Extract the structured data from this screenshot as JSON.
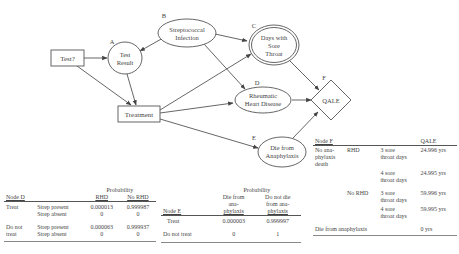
{
  "diagram": {
    "nodes": {
      "test": {
        "label": "Test?",
        "shape": "rectangle"
      },
      "test_result": {
        "letter": "A",
        "lines": [
          "Test",
          "Result"
        ],
        "shape": "ellipse"
      },
      "strep": {
        "letter": "B",
        "lines": [
          "Streptococcal",
          "Infection"
        ],
        "shape": "ellipse"
      },
      "sore_throat": {
        "letter": "C",
        "lines": [
          "Days with",
          "Sore",
          "Throat"
        ],
        "shape": "double-ellipse"
      },
      "rhd": {
        "letter": "D",
        "lines": [
          "Rheumatic",
          "Heart Disease"
        ],
        "shape": "ellipse"
      },
      "anaphylaxis": {
        "letter": "E",
        "lines": [
          "Die from",
          "Anaphylaxis"
        ],
        "shape": "ellipse"
      },
      "qale": {
        "letter": "F",
        "label": "QALE",
        "shape": "diamond"
      },
      "treatment": {
        "label": "Treatment",
        "shape": "rectangle"
      }
    },
    "edges": [
      [
        "Test?",
        "Test Result"
      ],
      [
        "Test?",
        "Treatment"
      ],
      [
        "Streptococcal Infection",
        "Test Result"
      ],
      [
        "Streptococcal Infection",
        "Days with Sore Throat"
      ],
      [
        "Streptococcal Infection",
        "Rheumatic Heart Disease"
      ],
      [
        "Test Result",
        "Treatment"
      ],
      [
        "Treatment",
        "Days with Sore Throat"
      ],
      [
        "Treatment",
        "Rheumatic Heart Disease"
      ],
      [
        "Treatment",
        "Die from Anaphylaxis"
      ],
      [
        "Days with Sore Throat",
        "QALE"
      ],
      [
        "Rheumatic Heart Disease",
        "QALE"
      ],
      [
        "Die from Anaphylaxis",
        "QALE"
      ]
    ]
  },
  "table_d": {
    "node": "Node D",
    "prob_header": "Probability",
    "col_rhd": "RHD",
    "col_no_rhd": "No RHD",
    "rows": [
      {
        "group": "Treat",
        "cond": "Strep present",
        "rhd": "0.000013",
        "no_rhd": "0.999987"
      },
      {
        "group": "",
        "cond": "Strep absent",
        "rhd": "0",
        "no_rhd": "0"
      },
      {
        "group": "Do not treat",
        "group_l1": "Do not",
        "group_l2": "treat",
        "cond": "Strep present",
        "rhd": "0.000063",
        "no_rhd": "0.999937"
      },
      {
        "group": "",
        "cond": "Strep absent",
        "rhd": "0",
        "no_rhd": "0"
      }
    ]
  },
  "table_e": {
    "node": "Node E",
    "prob_header": "Probability",
    "col_die": [
      "Die from",
      "ana-",
      "phylaxis"
    ],
    "col_not_die": [
      "Do not die",
      "from ana-",
      "phylaxis"
    ],
    "rows": [
      {
        "label": "Treat",
        "die": "0.000003",
        "not_die": "0.999997"
      },
      {
        "label": "Do not treat",
        "die": "0",
        "not_die": "1"
      }
    ]
  },
  "table_f": {
    "node": "Node F",
    "col_qale": "QALE",
    "group1": [
      "No ana-",
      "phylaxis",
      "death"
    ],
    "rows": [
      {
        "rhd": "RHD",
        "days": [
          "3 sore",
          "throat days"
        ],
        "qale": "24.996 yrs"
      },
      {
        "rhd": "",
        "days": [
          "4 sore",
          "throat days"
        ],
        "qale": "24.995 yrs"
      },
      {
        "rhd": "No RHD",
        "days": [
          "3 sore",
          "throat days"
        ],
        "qale": "59.996 yrs"
      },
      {
        "rhd": "",
        "days": [
          "4 sore",
          "throat days"
        ],
        "qale": "59.995 yrs"
      }
    ],
    "last_row": {
      "label": "Die from anaphylaxis",
      "qale": "0 yrs"
    }
  }
}
